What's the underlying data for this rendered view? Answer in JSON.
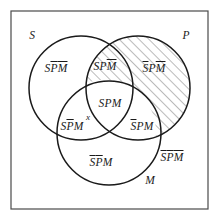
{
  "figure": {
    "frame": {
      "border_color": "#4a4a4a",
      "fill_color": "#ffffff"
    },
    "circle_stroke_color": "#1a1a1a",
    "hatch_color": "#555555",
    "text_color": "#1a1a1a"
  },
  "set_labels": [
    {
      "name": "S",
      "text": "S"
    },
    {
      "name": "P",
      "text": "P"
    },
    {
      "name": "M",
      "text": "M"
    }
  ],
  "regions": [
    {
      "id": "s-only",
      "parts": [
        {
          "t": "S",
          "bar": false
        },
        {
          "t": "P",
          "bar": true
        },
        {
          "t": "M",
          "bar": true
        }
      ],
      "hatched": false
    },
    {
      "id": "s-p-not-m",
      "parts": [
        {
          "t": "S",
          "bar": false
        },
        {
          "t": "P",
          "bar": false
        },
        {
          "t": "M",
          "bar": true
        }
      ],
      "hatched": true
    },
    {
      "id": "p-only",
      "parts": [
        {
          "t": "S",
          "bar": true
        },
        {
          "t": "P",
          "bar": false
        },
        {
          "t": "M",
          "bar": true
        }
      ],
      "hatched": true
    },
    {
      "id": "s-p-m",
      "parts": [
        {
          "t": "S",
          "bar": false
        },
        {
          "t": "P",
          "bar": false
        },
        {
          "t": "M",
          "bar": false
        }
      ],
      "hatched": false
    },
    {
      "id": "s-m-not-p",
      "parts": [
        {
          "t": "S",
          "bar": false
        },
        {
          "t": "P",
          "bar": true
        },
        {
          "t": "M",
          "bar": false
        }
      ],
      "hatched": false
    },
    {
      "id": "p-m-not-s",
      "parts": [
        {
          "t": "S",
          "bar": true
        },
        {
          "t": "P",
          "bar": false
        },
        {
          "t": "M",
          "bar": false
        }
      ],
      "hatched": false
    },
    {
      "id": "m-only",
      "parts": [
        {
          "t": "S",
          "bar": true
        },
        {
          "t": "P",
          "bar": true
        },
        {
          "t": "M",
          "bar": false
        }
      ],
      "hatched": false
    },
    {
      "id": "outside",
      "parts": [
        {
          "t": "S",
          "bar": true
        },
        {
          "t": "P",
          "bar": true
        },
        {
          "t": "M",
          "bar": true
        }
      ],
      "hatched": false
    }
  ],
  "markers": [
    {
      "id": "x-marker",
      "text": "x"
    }
  ]
}
